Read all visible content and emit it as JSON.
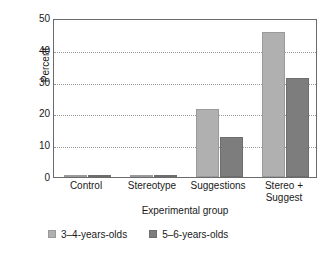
{
  "chart_data": {
    "type": "bar",
    "title": "",
    "xlabel": "Experimental group",
    "ylabel": "Percent",
    "categories": [
      "Control",
      "Stereotype",
      "Suggestions",
      "Stereo + Suggest"
    ],
    "category_lines": [
      [
        "Control"
      ],
      [
        "Stereotype"
      ],
      [
        "Suggestions"
      ],
      [
        "Stereo +",
        "Suggest"
      ]
    ],
    "series": [
      {
        "name": "3–4-years-olds",
        "color": "#b0b0b0",
        "values": [
          0,
          0,
          21.5,
          45.5
        ]
      },
      {
        "name": "5–6-years-olds",
        "color": "#7d7d7d",
        "values": [
          0,
          0,
          12.5,
          31
        ]
      }
    ],
    "ylim": [
      0,
      50
    ],
    "yticks": [
      0,
      10,
      20,
      30,
      40,
      50
    ],
    "ytick_labels": [
      "0",
      "10",
      "20",
      "30",
      "40",
      "50"
    ],
    "grid": "horizontal-dotted",
    "legend_position": "bottom-left",
    "frame": true
  }
}
